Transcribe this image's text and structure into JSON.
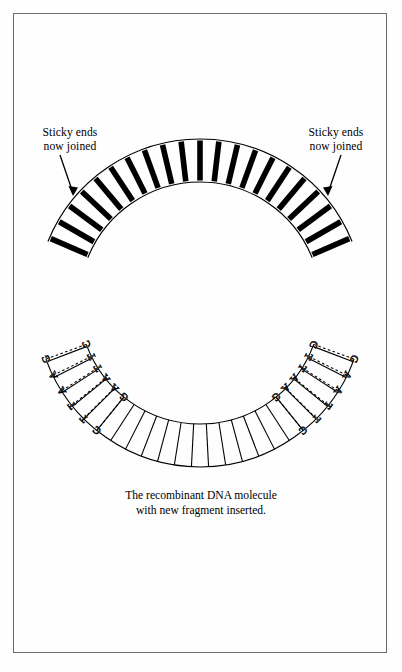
{
  "page": {
    "background": "#fefefe",
    "border_color": "#6d6d6d",
    "ink": "#000000"
  },
  "figure": {
    "title_caption": "The recombinant DNA molecule\nwith new fragment inserted.",
    "labels": {
      "left": "Sticky ends\nnow joined",
      "right": "Sticky ends\nnow joined"
    },
    "circle": {
      "center_x": 200,
      "center_y": 303,
      "outer_radius": 164,
      "inner_radius": 121,
      "description": "circular recombinant plasmid DNA, double-stranded ring"
    },
    "segments": {
      "inserted_fragment": {
        "style": "thick-black-rungs",
        "rung_count": 21,
        "start_angle_deg": -160,
        "end_angle_deg": -20,
        "note": "newly inserted DNA fragment across top arc"
      },
      "original_plasmid": {
        "style": "thin-line-rungs",
        "rung_count": 24,
        "start_angle_deg": 18,
        "end_angle_deg": 162,
        "note": "original plasmid vector across bottom arc"
      }
    },
    "sticky_end_junctions": [
      {
        "side": "left",
        "outer_strand_bases": [
          "G",
          "A",
          "A",
          "T",
          "T",
          "C"
        ],
        "inner_strand_bases": [
          "C",
          "T",
          "T",
          "A",
          "A",
          "G"
        ],
        "bond_style": "dashed",
        "note": "EcoRI site rejoined by ligase"
      },
      {
        "side": "right",
        "outer_strand_bases": [
          "G",
          "A",
          "A",
          "T",
          "T",
          "C"
        ],
        "inner_strand_bases": [
          "C",
          "T",
          "T",
          "A",
          "A",
          "G"
        ],
        "bond_style": "dashed",
        "note": "EcoRI site rejoined by ligase"
      }
    ],
    "arrows": [
      {
        "name": "left-pointer",
        "from_x": 60,
        "from_y": 155,
        "to_x": 72,
        "to_y": 190
      },
      {
        "name": "right-pointer",
        "from_x": 340,
        "from_y": 155,
        "to_x": 328,
        "to_y": 190
      }
    ]
  }
}
